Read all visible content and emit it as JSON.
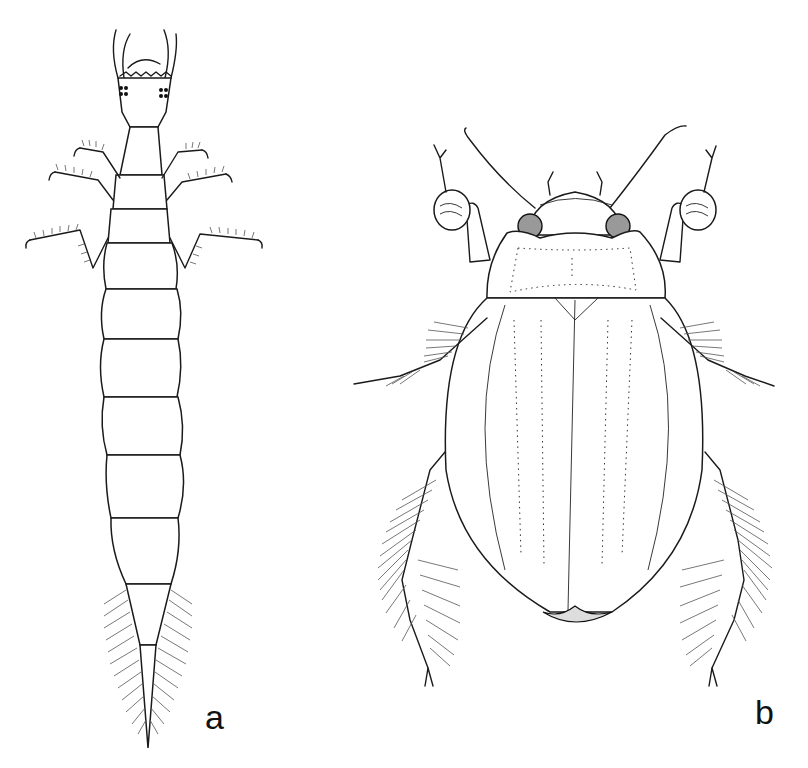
{
  "figure": {
    "panels": [
      {
        "id": "a",
        "label": "a",
        "subject": "larva-dorsal-view"
      },
      {
        "id": "b",
        "label": "b",
        "subject": "adult-beetle-dorsal-view"
      }
    ]
  },
  "colors": {
    "line": "#1a1a1a",
    "background": "#ffffff"
  }
}
